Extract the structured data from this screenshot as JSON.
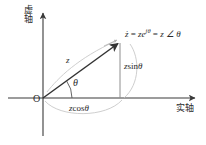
{
  "figure": {
    "background": "#ffffff"
  },
  "axes": {
    "imaginary": {
      "label": "虚轴",
      "char1": "虚",
      "char2": "轴",
      "orientation": "vertical",
      "arrow": "up-arrow-icon"
    },
    "real": {
      "label": "实轴",
      "orientation": "horizontal",
      "arrow": "right-arrow-icon"
    },
    "origin": {
      "label": "O"
    }
  },
  "labels": {
    "magnitude": "z",
    "angle": "θ",
    "tip_equation": {
      "lhs": "ż",
      "eq1": " = ",
      "exp_base": "ze",
      "exp_sup": "jθ",
      "eq2": " = ",
      "rhs": "z ∠ θ",
      "full": "ż = ze^{jθ} = z ∠ θ"
    },
    "vertical_projection": {
      "var": "z",
      "fn": "sin",
      "arg": "θ",
      "full": "z sin θ"
    },
    "horizontal_projection": {
      "var": "z",
      "fn": "cos",
      "arg": "θ",
      "full": "z cos θ"
    }
  },
  "colors": {
    "axis": "#3a3a3a",
    "vector": "#333333",
    "leader": "#b9b9b9",
    "projection": "#8e8e8e",
    "text": "#2b2b2b"
  },
  "geometry": {
    "origin_px": [
      43,
      98
    ],
    "tip_px": [
      120,
      42
    ],
    "x_axis_end_px": [
      196,
      98
    ],
    "y_axis_top_px": [
      43,
      12
    ],
    "angle_deg": 36
  }
}
